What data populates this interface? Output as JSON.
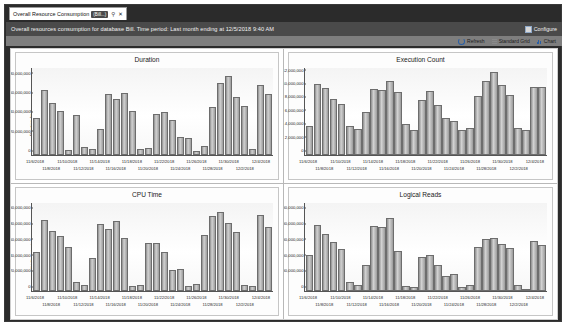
{
  "window": {
    "tab": {
      "label": "Overall Resource Consumption",
      "badge": "(Bill...)",
      "pin_icon": "pin-icon",
      "close_icon": "close-icon"
    },
    "header": {
      "text": "Overall resources consumption for database Bill. Time period: Last month ending at 12/5/2018 9:40 AM",
      "configure_label": "Configure",
      "configure_icon": "configure-icon"
    },
    "toolbar": {
      "refresh_label": "Refresh",
      "refresh_icon": "refresh-icon",
      "standard_grid_label": "Standard Grid",
      "standard_grid_icon": "grid-icon",
      "chart_label": "Chart",
      "chart_icon": "chart-icon"
    }
  },
  "colors": {
    "header_band": "#4a4a4a",
    "toolbar_band": "#7e7e7e",
    "window_frame": "#2b2b2b",
    "bar_fill": "#b9b9b9",
    "bar_stroke": "#6d6d6d"
  },
  "chart_data": [
    {
      "type": "bar",
      "title": "Duration",
      "xlabel": "",
      "ylabel": "Duration (ms)",
      "ylim": [
        0,
        90000000
      ],
      "yticks": [
        0,
        20000000,
        40000000,
        60000000,
        80000000
      ],
      "ytick_labels": [
        "0",
        "20,000,000",
        "40,000,000",
        "60,000,000",
        "80,000,000"
      ],
      "grid": false,
      "legend": "none",
      "categories": [
        "11/6/2018",
        "11/7/2018",
        "11/8/2018",
        "11/9/2018",
        "11/10/2018",
        "11/11/2018",
        "11/12/2018",
        "11/13/2018",
        "11/14/2018",
        "11/15/2018",
        "11/16/2018",
        "11/17/2018",
        "11/18/2018",
        "11/19/2018",
        "11/20/2018",
        "11/21/2018",
        "11/22/2018",
        "11/23/2018",
        "11/24/2018",
        "11/25/2018",
        "11/26/2018",
        "11/27/2018",
        "11/28/2018",
        "11/29/2018",
        "11/30/2018",
        "12/1/2018",
        "12/2/2018",
        "12/3/2018",
        "12/4/2018",
        "12/5/2018"
      ],
      "xtick_labels_row0": [
        "11/6/2018",
        "11/10/2018",
        "11/14/2018",
        "11/18/2018",
        "11/22/2018",
        "11/26/2018",
        "11/30/2018",
        "12/4/2018"
      ],
      "xtick_labels_row1": [
        "11/8/2018",
        "11/12/2018",
        "11/16/2018",
        "11/20/2018",
        "11/24/2018",
        "11/28/2018",
        "12/2/2018"
      ],
      "values": [
        38000000,
        67000000,
        54000000,
        46000000,
        5000000,
        41000000,
        8000000,
        6000000,
        27000000,
        63000000,
        58000000,
        64000000,
        46000000,
        6000000,
        7000000,
        42000000,
        45000000,
        36000000,
        19000000,
        18000000,
        4000000,
        9000000,
        50000000,
        75000000,
        82000000,
        60000000,
        51000000,
        6000000,
        72000000,
        63000000
      ]
    },
    {
      "type": "bar",
      "title": "Execution Count",
      "xlabel": "",
      "ylabel": "Execution Count",
      "ylim": [
        0,
        13000000
      ],
      "yticks": [
        0,
        2000000,
        4000000,
        6000000,
        8000000,
        10000000,
        12000000
      ],
      "ytick_labels": [
        "0",
        "2,000,000",
        "4,000,000",
        "6,000,000",
        "8,000,000",
        "10,000,000",
        "12,000,000"
      ],
      "grid": false,
      "legend": "none",
      "categories": [
        "11/6/2018",
        "11/7/2018",
        "11/8/2018",
        "11/9/2018",
        "11/10/2018",
        "11/11/2018",
        "11/12/2018",
        "11/13/2018",
        "11/14/2018",
        "11/15/2018",
        "11/16/2018",
        "11/17/2018",
        "11/18/2018",
        "11/19/2018",
        "11/20/2018",
        "11/21/2018",
        "11/22/2018",
        "11/23/2018",
        "11/24/2018",
        "11/25/2018",
        "11/26/2018",
        "11/27/2018",
        "11/28/2018",
        "11/29/2018",
        "11/30/2018",
        "12/1/2018",
        "12/2/2018",
        "12/3/2018",
        "12/4/2018",
        "12/5/2018"
      ],
      "xtick_labels_row0": [
        "11/6/2018",
        "11/10/2018",
        "11/14/2018",
        "11/18/2018",
        "11/22/2018",
        "11/26/2018",
        "11/30/2018",
        "12/4/2018"
      ],
      "xtick_labels_row1": [
        "11/8/2018",
        "11/12/2018",
        "11/16/2018",
        "11/20/2018",
        "11/24/2018",
        "11/28/2018",
        "12/2/2018"
      ],
      "values": [
        4400000,
        10600000,
        10000000,
        8400000,
        7600000,
        4300000,
        3900000,
        6400000,
        9800000,
        9700000,
        11000000,
        9400000,
        4600000,
        3700000,
        8200000,
        9600000,
        7500000,
        5500000,
        5100000,
        3800000,
        4100000,
        8800000,
        11100000,
        12400000,
        10400000,
        9000000,
        4100000,
        3800000,
        10200000,
        10200000
      ]
    },
    {
      "type": "bar",
      "title": "CPU Time",
      "xlabel": "",
      "ylabel": "CPU Time (ms)",
      "ylim": [
        0,
        112000000
      ],
      "yticks": [
        0,
        20000000,
        40000000,
        60000000,
        80000000,
        100000000
      ],
      "ytick_labels": [
        "0",
        "20,000,000",
        "40,000,000",
        "60,000,000",
        "80,000,000",
        "100,000,000"
      ],
      "grid": false,
      "legend": "none",
      "categories": [
        "11/6/2018",
        "11/7/2018",
        "11/8/2018",
        "11/9/2018",
        "11/10/2018",
        "11/11/2018",
        "11/12/2018",
        "11/13/2018",
        "11/14/2018",
        "11/15/2018",
        "11/16/2018",
        "11/17/2018",
        "11/18/2018",
        "11/19/2018",
        "11/20/2018",
        "11/21/2018",
        "11/22/2018",
        "11/23/2018",
        "11/24/2018",
        "11/25/2018",
        "11/26/2018",
        "11/27/2018",
        "11/28/2018",
        "11/29/2018",
        "11/30/2018",
        "12/1/2018",
        "12/2/2018",
        "12/3/2018",
        "12/4/2018",
        "12/5/2018"
      ],
      "xtick_labels_row0": [
        "11/6/2018",
        "11/10/2018",
        "11/14/2018",
        "11/18/2018",
        "11/22/2018",
        "11/26/2018",
        "11/30/2018",
        "12/4/2018"
      ],
      "xtick_labels_row1": [
        "11/8/2018",
        "11/12/2018",
        "11/16/2018",
        "11/20/2018",
        "11/24/2018",
        "11/28/2018",
        "12/2/2018"
      ],
      "values": [
        50000000,
        90000000,
        77000000,
        70000000,
        56000000,
        11000000,
        8000000,
        42000000,
        85000000,
        79000000,
        89000000,
        67000000,
        6000000,
        8000000,
        61000000,
        61000000,
        50000000,
        27000000,
        28000000,
        7000000,
        9000000,
        71000000,
        95000000,
        101000000,
        87000000,
        75000000,
        8000000,
        6000000,
        97000000,
        82000000
      ]
    },
    {
      "type": "bar",
      "title": "Logical Reads",
      "xlabel": "",
      "ylabel": "Logical Reads (KB)",
      "ylim": [
        0,
        112000000000
      ],
      "yticks": [
        0,
        20000000000,
        40000000000,
        60000000000,
        80000000000,
        100000000000
      ],
      "ytick_labels": [
        "0",
        "20,000,000,000",
        "40,000,000,000",
        "60,000,000,000",
        "80,000,000,000",
        "100,000,000,000"
      ],
      "grid": false,
      "legend": "none",
      "categories": [
        "11/6/2018",
        "11/7/2018",
        "11/8/2018",
        "11/9/2018",
        "11/10/2018",
        "11/11/2018",
        "11/12/2018",
        "11/13/2018",
        "11/14/2018",
        "11/15/2018",
        "11/16/2018",
        "11/17/2018",
        "11/18/2018",
        "11/19/2018",
        "11/20/2018",
        "11/21/2018",
        "11/22/2018",
        "11/23/2018",
        "11/24/2018",
        "11/25/2018",
        "11/26/2018",
        "11/27/2018",
        "11/28/2018",
        "11/29/2018",
        "11/30/2018",
        "12/1/2018",
        "12/2/2018",
        "12/3/2018",
        "12/4/2018",
        "12/5/2018"
      ],
      "xtick_labels_row0": [
        "11/6/2018",
        "11/10/2018",
        "11/14/2018",
        "11/18/2018",
        "11/22/2018",
        "11/26/2018",
        "11/30/2018",
        "12/4/2018"
      ],
      "xtick_labels_row1": [
        "11/8/2018",
        "11/12/2018",
        "11/16/2018",
        "11/20/2018",
        "11/24/2018",
        "11/28/2018",
        "12/2/2018"
      ],
      "values": [
        46000000000,
        84000000000,
        73000000000,
        62000000000,
        54000000000,
        11000000000,
        8000000000,
        33000000000,
        83000000000,
        81000000000,
        93000000000,
        51000000000,
        7000000000,
        5000000000,
        43000000000,
        46000000000,
        33000000000,
        19000000000,
        22000000000,
        5000000000,
        8000000000,
        56000000000,
        66000000000,
        68000000000,
        60000000000,
        55000000000,
        8000000000,
        3000000000,
        64000000000,
        59000000000
      ]
    }
  ]
}
